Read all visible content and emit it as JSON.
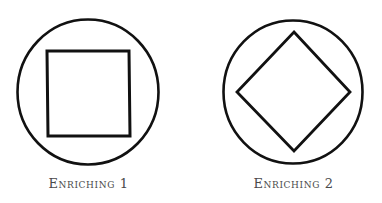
{
  "figures": [
    {
      "label": "Enriching 1",
      "outer_shape": "circle",
      "inner_shape": "square",
      "circle": {
        "cx": 88,
        "cy": 92,
        "rx": 70.5,
        "ry": 72.5
      },
      "inner_points": "47,51 129,51 130,136 48,136"
    },
    {
      "label": "Enriching 2",
      "outer_shape": "circle",
      "inner_shape": "diamond",
      "circle": {
        "cx": 102,
        "cy": 92,
        "rx": 69.5,
        "ry": 71.5
      },
      "inner_points": "103,32 159,92 103,151 46,92"
    }
  ],
  "colors": {
    "stroke": "#111111",
    "label": "#4a4a4a",
    "background": "#ffffff"
  }
}
